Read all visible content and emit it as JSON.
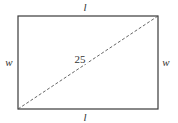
{
  "diagram": {
    "shape": "rectangle",
    "rect": {
      "x": 18,
      "y": 16,
      "width": 140,
      "height": 93
    },
    "stroke_color": "#3a3a3a",
    "diagonal": {
      "style": "dashed",
      "from": "bottom-left",
      "to": "top-right",
      "label": "25"
    },
    "labels": {
      "top": "l",
      "bottom": "l",
      "left": "w",
      "right": "w"
    }
  }
}
